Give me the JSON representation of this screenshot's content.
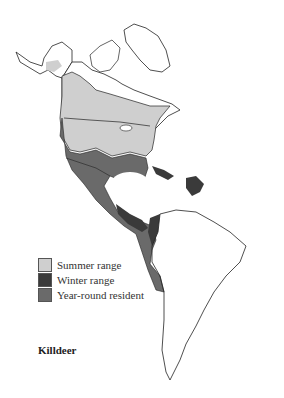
{
  "map": {
    "region": "North, Central and South America",
    "style": "grayscale range map",
    "colors": {
      "land": "#ffffff",
      "coastline": "#222222",
      "summer_range": "#cfcfcf",
      "winter_range": "#3a3a3a",
      "year_round_resident": "#6a6a6a"
    }
  },
  "legend": {
    "items": [
      {
        "label": "Summer range",
        "color": "#cfcfcf"
      },
      {
        "label": "Winter range",
        "color": "#3a3a3a"
      },
      {
        "label": "Year-round resident",
        "color": "#6a6a6a"
      }
    ]
  },
  "caption": {
    "species": "Killdeer"
  }
}
